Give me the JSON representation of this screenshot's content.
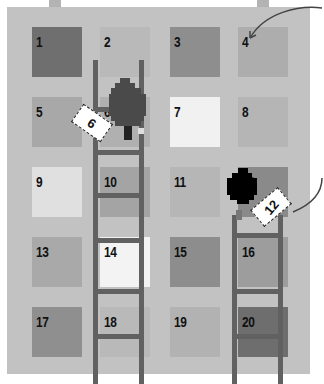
{
  "board": {
    "title": "",
    "background": "#c2c2c2",
    "cells": [
      {
        "n": "1",
        "color": "#6f6f6f"
      },
      {
        "n": "2",
        "color": "#b9b9b9"
      },
      {
        "n": "3",
        "color": "#8e8e8e"
      },
      {
        "n": "4",
        "color": "#adadad"
      },
      {
        "n": "5",
        "color": "#a8a8a8"
      },
      {
        "n": "6",
        "color": "#b0b0b0"
      },
      {
        "n": "7",
        "color": "#f1f1f1"
      },
      {
        "n": "8",
        "color": "#b5b5b5"
      },
      {
        "n": "9",
        "color": "#e0e0e0"
      },
      {
        "n": "10",
        "color": "#a4a4a4"
      },
      {
        "n": "11",
        "color": "#b6b6b6"
      },
      {
        "n": "12",
        "color": "#8a8a8a"
      },
      {
        "n": "13",
        "color": "#a9a9a9"
      },
      {
        "n": "14",
        "color": "#f3f3f3"
      },
      {
        "n": "15",
        "color": "#8d8d8d"
      },
      {
        "n": "16",
        "color": "#9d9d9d"
      },
      {
        "n": "17",
        "color": "#8f8f8f"
      },
      {
        "n": "18",
        "color": "#b9b9b9"
      },
      {
        "n": "19",
        "color": "#b2b2b2"
      },
      {
        "n": "20",
        "color": "#6e6e6e"
      }
    ]
  },
  "callouts": {
    "card_left": "6",
    "card_right": "12"
  },
  "colors": {
    "ladder": "#616161",
    "player_left": "#4a4a4a",
    "player_right": "#000000",
    "arrow": "#444444"
  }
}
